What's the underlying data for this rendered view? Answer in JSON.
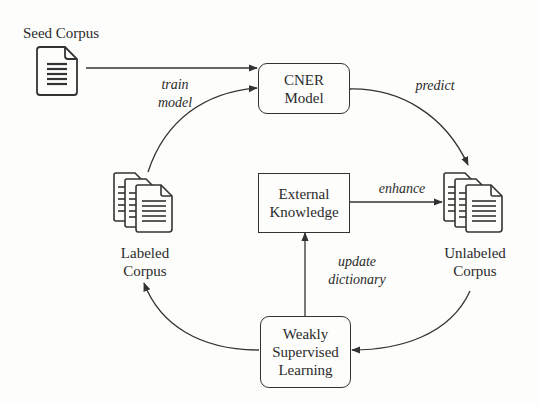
{
  "diagram": {
    "nodes": {
      "seed_corpus": {
        "label": "Seed Corpus",
        "icon": "document-icon"
      },
      "cner_model": {
        "line1": "CNER",
        "line2": "Model",
        "shape": "rounded-rect"
      },
      "external_knowledge": {
        "line1": "External",
        "line2": "Knowledge",
        "shape": "rect"
      },
      "labeled_corpus": {
        "line1": "Labeled",
        "line2": "Corpus",
        "icon": "documents-stack-icon"
      },
      "unlabeled_corpus": {
        "line1": "Unlabeled",
        "line2": "Corpus",
        "icon": "documents-stack-icon"
      },
      "weakly_supervised_learning": {
        "line1": "Weakly",
        "line2": "Supervised",
        "line3": "Learning",
        "shape": "rounded-rect"
      }
    },
    "edges": {
      "seed_to_cner": {
        "from": "Seed Corpus",
        "to": "CNER Model",
        "label": ""
      },
      "labeled_to_cner": {
        "from": "Labeled Corpus",
        "to": "CNER Model",
        "label_line1": "train",
        "label_line2": "model"
      },
      "cner_to_unlabeled": {
        "from": "CNER Model",
        "to": "Unlabeled Corpus",
        "label": "predict"
      },
      "external_to_unlabeled": {
        "from": "External Knowledge",
        "to": "Unlabeled Corpus",
        "label": "enhance"
      },
      "wsl_to_external": {
        "from": "Weakly Supervised Learning",
        "to": "External Knowledge",
        "label_line1": "update",
        "label_line2": "dictionary"
      },
      "unlabeled_to_wsl": {
        "from": "Unlabeled Corpus",
        "to": "Weakly Supervised Learning",
        "label": ""
      },
      "wsl_to_labeled": {
        "from": "Weakly Supervised Learning",
        "to": "Labeled Corpus",
        "label": ""
      }
    },
    "colors": {
      "stroke": "#333333",
      "background": "#fdfdfb",
      "text": "#2b2b2b"
    }
  }
}
